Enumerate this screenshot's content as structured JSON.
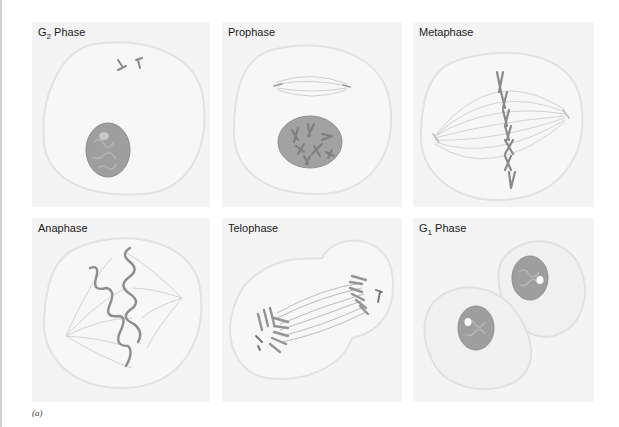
{
  "figure": {
    "caption": "(a)",
    "colors": {
      "background": "#ffffff",
      "panel_bg": "#f4f4f4",
      "cell_outline": "#e4e4e4",
      "cell_fill": "#f7f7f7",
      "nucleus": "#9a9a9a",
      "nucleus_dark": "#7f7f7f",
      "chromosome": "#8c8c8c",
      "spindle": "#cfcfcf",
      "label": "#1a1a1a"
    },
    "panels": [
      {
        "id": "g2",
        "label_main": "G",
        "label_sub": "2",
        "label_rest": " Phase"
      },
      {
        "id": "prophase",
        "label_main": "Prophase",
        "label_sub": "",
        "label_rest": ""
      },
      {
        "id": "metaphase",
        "label_main": "Metaphase",
        "label_sub": "",
        "label_rest": ""
      },
      {
        "id": "anaphase",
        "label_main": "Anaphase",
        "label_sub": "",
        "label_rest": ""
      },
      {
        "id": "telophase",
        "label_main": "Telophase",
        "label_sub": "",
        "label_rest": ""
      },
      {
        "id": "g1",
        "label_main": "G",
        "label_sub": "1",
        "label_rest": " Phase"
      }
    ]
  }
}
